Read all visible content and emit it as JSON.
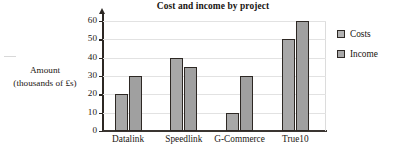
{
  "chart_data": {
    "type": "bar",
    "title": "Cost and income by project",
    "categories": [
      "Datalink",
      "Speedlink",
      "G-Commerce",
      "True10"
    ],
    "series": [
      {
        "name": "Costs",
        "values": [
          20,
          40,
          10,
          50
        ],
        "color": "#a8a8a8"
      },
      {
        "name": "Income",
        "values": [
          30,
          35,
          30,
          60
        ],
        "color": "#a0a0a0"
      }
    ],
    "xlabel": "",
    "ylabel": "Amount (thousands of £s)",
    "ylabel_lines": [
      "Amount",
      "(thousands of £s)"
    ],
    "ylim": [
      0,
      60
    ],
    "ytick_labels": [
      "0",
      "10",
      "20",
      "30",
      "40",
      "50",
      "60"
    ],
    "ytick_values": [
      0,
      10,
      20,
      30,
      40,
      50,
      60
    ],
    "grid": true,
    "legend_position": "right",
    "legend_entries": [
      "Costs",
      "Income"
    ]
  }
}
